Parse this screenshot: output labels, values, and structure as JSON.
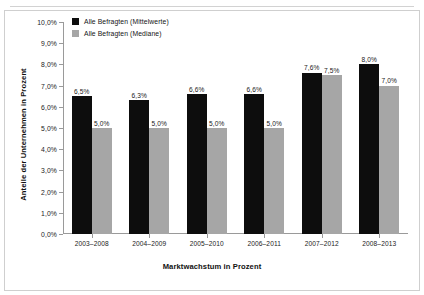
{
  "chart_data": {
    "type": "bar",
    "title": "",
    "xlabel": "Marktwachstum in Prozent",
    "ylabel": "Anteile der Unternehmen in Prozent",
    "categories": [
      "2003–2008",
      "2004–2009",
      "2005–2010",
      "2006–2011",
      "2007–2012",
      "2008–2013"
    ],
    "series": [
      {
        "name": "Alle Befragten (Mittelwerte)",
        "color": "#0d0d0d",
        "values": [
          6.5,
          6.3,
          6.6,
          6.6,
          7.6,
          8.0
        ],
        "labels": [
          "6,5%",
          "6,3%",
          "6,6%",
          "6,6%",
          "7,6%",
          "8,0%"
        ]
      },
      {
        "name": "Alle Befragten (Mediane)",
        "color": "#a6a6a6",
        "values": [
          5.0,
          5.0,
          5.0,
          5.0,
          7.5,
          7.0
        ],
        "labels": [
          "5,0%",
          "5,0%",
          "5,0%",
          "5,0%",
          "7,5%",
          "7,0%"
        ]
      }
    ],
    "ylim": [
      0,
      10
    ],
    "ytick_values": [
      10.0,
      9.0,
      8.0,
      7.0,
      6.0,
      5.0,
      4.0,
      3.0,
      2.0,
      1.0,
      0.0
    ],
    "ytick_labels": [
      "10,0%",
      "9,0%",
      "8,0%",
      "7,0%",
      "6,0%",
      "5,0%",
      "4,0%",
      "3,0%",
      "2,0%",
      "1,0%",
      "0,0%"
    ],
    "grid": false,
    "legend_position": "top-left"
  },
  "legend": {
    "items": [
      {
        "label": "Alle Befragten (Mittelwerte)"
      },
      {
        "label": "Alle Befragten (Mediane)"
      }
    ]
  }
}
